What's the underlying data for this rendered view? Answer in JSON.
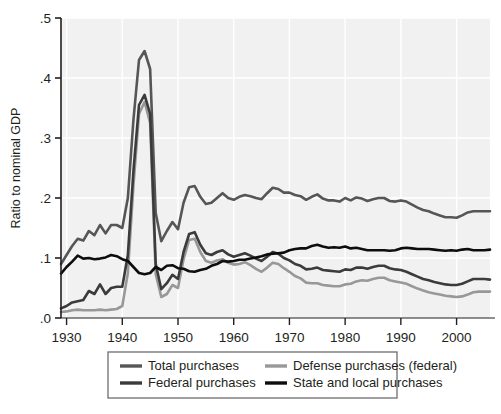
{
  "chart_data": {
    "type": "line",
    "title": "",
    "xlabel": "",
    "ylabel": "Ratio to nominal GDP",
    "xlim": [
      1929,
      2006
    ],
    "ylim": [
      0.0,
      0.5
    ],
    "xticks": [
      1930,
      1940,
      1950,
      1960,
      1970,
      1980,
      1990,
      2000
    ],
    "xticklabels": [
      "1930",
      "1940",
      "1950",
      "1960",
      "1970",
      "1980",
      "1990",
      "2000"
    ],
    "yticks": [
      0.0,
      0.1,
      0.2,
      0.3,
      0.4,
      0.5
    ],
    "yticklabels": [
      ".0",
      ".1",
      ".2",
      ".3",
      ".4",
      ".5"
    ],
    "grid": true,
    "grid_color": "#ffffff",
    "plot_background": "#f1f1f1",
    "legend_position": "below-center",
    "x": [
      1929,
      1930,
      1931,
      1932,
      1933,
      1934,
      1935,
      1936,
      1937,
      1938,
      1939,
      1940,
      1941,
      1942,
      1943,
      1944,
      1945,
      1946,
      1947,
      1948,
      1949,
      1950,
      1951,
      1952,
      1953,
      1954,
      1955,
      1956,
      1957,
      1958,
      1959,
      1960,
      1961,
      1962,
      1963,
      1964,
      1965,
      1966,
      1967,
      1968,
      1969,
      1970,
      1971,
      1972,
      1973,
      1974,
      1975,
      1976,
      1977,
      1978,
      1979,
      1980,
      1981,
      1982,
      1983,
      1984,
      1985,
      1986,
      1987,
      1988,
      1989,
      1990,
      1991,
      1992,
      1993,
      1994,
      1995,
      1996,
      1997,
      1998,
      1999,
      2000,
      2001,
      2002,
      2003,
      2004,
      2005,
      2006
    ],
    "series": [
      {
        "name": "Total purchases",
        "color": "#565656",
        "values": [
          0.09,
          0.105,
          0.12,
          0.132,
          0.129,
          0.145,
          0.138,
          0.155,
          0.141,
          0.155,
          0.155,
          0.15,
          0.2,
          0.33,
          0.43,
          0.445,
          0.415,
          0.175,
          0.128,
          0.145,
          0.16,
          0.148,
          0.192,
          0.218,
          0.22,
          0.202,
          0.19,
          0.192,
          0.2,
          0.208,
          0.2,
          0.197,
          0.202,
          0.205,
          0.203,
          0.2,
          0.198,
          0.208,
          0.217,
          0.215,
          0.209,
          0.209,
          0.205,
          0.203,
          0.197,
          0.202,
          0.206,
          0.199,
          0.196,
          0.196,
          0.194,
          0.2,
          0.196,
          0.201,
          0.199,
          0.195,
          0.198,
          0.2,
          0.2,
          0.195,
          0.194,
          0.196,
          0.194,
          0.189,
          0.184,
          0.18,
          0.178,
          0.174,
          0.171,
          0.168,
          0.168,
          0.167,
          0.171,
          0.176,
          0.178,
          0.178,
          0.178,
          0.178
        ]
      },
      {
        "name": "Federal purchases",
        "color": "#3b3b3b",
        "values": [
          0.016,
          0.02,
          0.026,
          0.028,
          0.03,
          0.045,
          0.04,
          0.056,
          0.04,
          0.05,
          0.052,
          0.052,
          0.105,
          0.245,
          0.355,
          0.372,
          0.34,
          0.09,
          0.048,
          0.058,
          0.072,
          0.065,
          0.11,
          0.14,
          0.143,
          0.122,
          0.108,
          0.105,
          0.11,
          0.113,
          0.106,
          0.102,
          0.105,
          0.108,
          0.104,
          0.099,
          0.095,
          0.102,
          0.11,
          0.107,
          0.1,
          0.096,
          0.09,
          0.087,
          0.081,
          0.082,
          0.084,
          0.08,
          0.079,
          0.078,
          0.077,
          0.081,
          0.08,
          0.084,
          0.084,
          0.082,
          0.085,
          0.087,
          0.087,
          0.083,
          0.081,
          0.08,
          0.077,
          0.073,
          0.069,
          0.065,
          0.063,
          0.06,
          0.058,
          0.056,
          0.055,
          0.055,
          0.057,
          0.061,
          0.065,
          0.065,
          0.065,
          0.064
        ]
      },
      {
        "name": "Defense purchases (federal)",
        "color": "#989898",
        "values": [
          0.01,
          0.011,
          0.013,
          0.014,
          0.013,
          0.013,
          0.013,
          0.014,
          0.013,
          0.014,
          0.015,
          0.02,
          0.075,
          0.22,
          0.34,
          0.36,
          0.325,
          0.073,
          0.035,
          0.04,
          0.055,
          0.05,
          0.098,
          0.13,
          0.132,
          0.11,
          0.095,
          0.092,
          0.096,
          0.098,
          0.092,
          0.089,
          0.09,
          0.093,
          0.088,
          0.082,
          0.077,
          0.084,
          0.092,
          0.09,
          0.083,
          0.077,
          0.07,
          0.066,
          0.059,
          0.058,
          0.058,
          0.055,
          0.054,
          0.053,
          0.053,
          0.056,
          0.057,
          0.061,
          0.063,
          0.062,
          0.065,
          0.067,
          0.067,
          0.063,
          0.061,
          0.059,
          0.057,
          0.053,
          0.049,
          0.046,
          0.043,
          0.041,
          0.039,
          0.037,
          0.036,
          0.035,
          0.036,
          0.039,
          0.043,
          0.044,
          0.044,
          0.044
        ]
      },
      {
        "name": "State and local purchases",
        "color": "#0d0d0d",
        "values": [
          0.074,
          0.085,
          0.094,
          0.104,
          0.099,
          0.1,
          0.098,
          0.099,
          0.101,
          0.105,
          0.103,
          0.098,
          0.095,
          0.085,
          0.075,
          0.073,
          0.075,
          0.085,
          0.08,
          0.087,
          0.088,
          0.083,
          0.082,
          0.078,
          0.077,
          0.08,
          0.082,
          0.087,
          0.09,
          0.095,
          0.094,
          0.095,
          0.097,
          0.097,
          0.099,
          0.101,
          0.103,
          0.106,
          0.107,
          0.108,
          0.109,
          0.113,
          0.115,
          0.116,
          0.116,
          0.12,
          0.122,
          0.119,
          0.117,
          0.118,
          0.117,
          0.119,
          0.116,
          0.117,
          0.115,
          0.113,
          0.113,
          0.113,
          0.113,
          0.112,
          0.113,
          0.116,
          0.117,
          0.116,
          0.115,
          0.115,
          0.115,
          0.114,
          0.113,
          0.112,
          0.113,
          0.112,
          0.114,
          0.115,
          0.113,
          0.113,
          0.113,
          0.114
        ]
      }
    ],
    "legend": [
      {
        "label": "Total purchases",
        "color": "#565656"
      },
      {
        "label": "Federal purchases",
        "color": "#3b3b3b"
      },
      {
        "label": "Defense purchases (federal)",
        "color": "#989898"
      },
      {
        "label": "State and local purchases",
        "color": "#0d0d0d"
      }
    ]
  }
}
